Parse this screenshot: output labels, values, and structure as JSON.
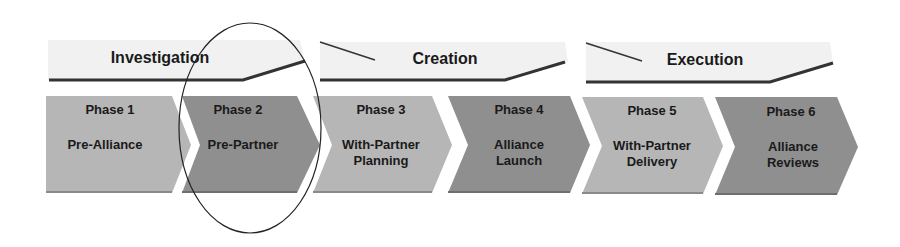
{
  "stages": [
    {
      "label": "Investigation"
    },
    {
      "label": "Creation"
    },
    {
      "label": "Execution"
    }
  ],
  "phases": [
    {
      "number": "Phase 1",
      "name": "Pre-Alliance",
      "shade": "#b6b6b6"
    },
    {
      "number": "Phase 2",
      "name": "Pre-Partner",
      "shade": "#8f8f8f",
      "highlighted": true
    },
    {
      "number": "Phase 3",
      "name": "With-Partner\nPlanning",
      "shade": "#b6b6b6"
    },
    {
      "number": "Phase 4",
      "name": "Alliance\nLaunch",
      "shade": "#8f8f8f"
    },
    {
      "number": "Phase 5",
      "name": "With-Partner\nDelivery",
      "shade": "#b6b6b6"
    },
    {
      "number": "Phase 6",
      "name": "Alliance\nReviews",
      "shade": "#8f8f8f"
    }
  ],
  "colors": {
    "light_phase": "#b6b6b6",
    "dark_phase": "#8f8f8f",
    "stage_band": "#f0f0f0",
    "stage_line": "#333333",
    "highlight_ellipse": "#222222"
  }
}
